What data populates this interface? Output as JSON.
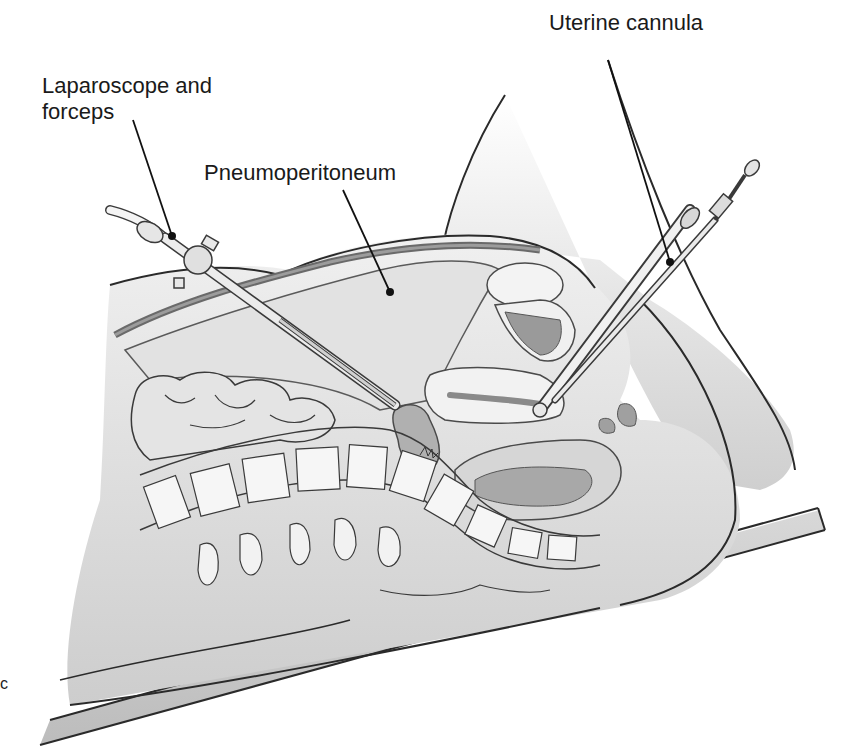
{
  "figure": {
    "panel_letter": "c",
    "labels": [
      {
        "id": "laparoscope",
        "line1": "Laparoscope and",
        "line2": "forceps"
      },
      {
        "id": "pneumoperitoneum",
        "line1": "Pneumoperitoneum"
      },
      {
        "id": "uterine-cannula",
        "line1": "Uterine cannula"
      }
    ],
    "colors": {
      "outline": "#2a2a2a",
      "skin": "#e8e8e8",
      "cavity": "#dcdcdc",
      "organ_dark": "#9a9a9a",
      "organ_mid": "#b8b8b8",
      "bone": "#f4f4f4",
      "table": "#d0d0d0"
    }
  }
}
